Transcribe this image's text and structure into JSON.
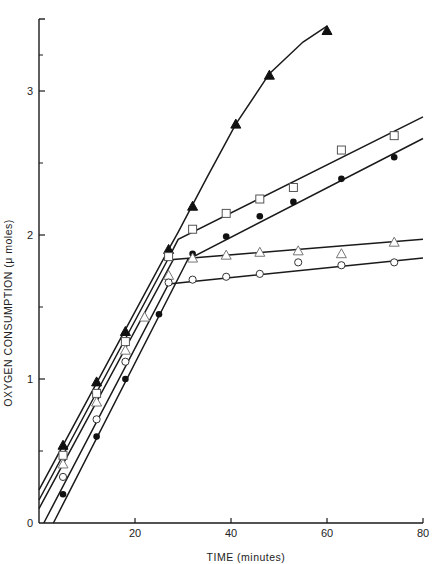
{
  "chart_data": {
    "type": "line",
    "title": "",
    "xlabel": "TIME (minutes)",
    "ylabel": "OXYGEN CONSUMPTION (μ moles)",
    "xlim": [
      0,
      80
    ],
    "ylim": [
      0,
      3.5
    ],
    "x_ticks": [
      20,
      40,
      60,
      80
    ],
    "x_tick_labels": [
      "20",
      "40",
      "60",
      "80"
    ],
    "y_ticks": [
      0,
      1,
      2,
      3
    ],
    "y_tick_labels": [
      "0",
      "1",
      "2",
      "3"
    ],
    "y_minor_ticks": [
      0.5,
      1.5,
      2.5,
      3.25
    ],
    "grid": false,
    "legend": null,
    "series": [
      {
        "name": "filled-triangle",
        "marker": "triangle-filled",
        "points": [
          [
            5,
            0.54
          ],
          [
            12,
            0.98
          ],
          [
            18,
            1.33
          ],
          [
            27,
            1.9
          ],
          [
            32,
            2.2
          ],
          [
            41,
            2.77
          ],
          [
            48,
            3.11
          ],
          [
            60,
            3.42
          ]
        ],
        "fit": [
          [
            0,
            0.23
          ],
          [
            27,
            1.9
          ],
          [
            29,
            2.02
          ],
          [
            35,
            2.4
          ],
          [
            41,
            2.77
          ],
          [
            48,
            3.12
          ],
          [
            55,
            3.34
          ],
          [
            60,
            3.45
          ]
        ]
      },
      {
        "name": "open-square",
        "marker": "square-open",
        "points": [
          [
            5,
            0.47
          ],
          [
            12,
            0.9
          ],
          [
            18,
            1.26
          ],
          [
            27,
            1.85
          ],
          [
            32,
            2.04
          ],
          [
            39,
            2.15
          ],
          [
            46,
            2.25
          ],
          [
            53,
            2.33
          ],
          [
            63,
            2.59
          ],
          [
            74,
            2.69
          ]
        ],
        "fit": [
          [
            0,
            0.16
          ],
          [
            27,
            1.84
          ],
          [
            29,
            1.97
          ],
          [
            80,
            2.82
          ]
        ]
      },
      {
        "name": "filled-circle",
        "marker": "circle-filled",
        "points": [
          [
            5,
            0.2
          ],
          [
            12,
            0.6
          ],
          [
            18,
            1.0
          ],
          [
            25,
            1.45
          ],
          [
            32,
            1.87
          ],
          [
            39,
            1.99
          ],
          [
            46,
            2.13
          ],
          [
            53,
            2.23
          ],
          [
            63,
            2.39
          ],
          [
            74,
            2.54
          ]
        ],
        "fit": [
          [
            3,
            0.0
          ],
          [
            31,
            1.83
          ],
          [
            80,
            2.67
          ]
        ]
      },
      {
        "name": "open-triangle",
        "marker": "triangle-open",
        "points": [
          [
            5,
            0.41
          ],
          [
            12,
            0.84
          ],
          [
            18,
            1.2
          ],
          [
            22,
            1.43
          ],
          [
            27,
            1.72
          ],
          [
            32,
            1.84
          ],
          [
            39,
            1.86
          ],
          [
            46,
            1.88
          ],
          [
            54,
            1.89
          ],
          [
            63,
            1.87
          ],
          [
            74,
            1.95
          ]
        ],
        "fit": [
          [
            0,
            0.1
          ],
          [
            28,
            1.83
          ],
          [
            80,
            1.97
          ]
        ]
      },
      {
        "name": "open-circle",
        "marker": "circle-open",
        "points": [
          [
            5,
            0.32
          ],
          [
            12,
            0.72
          ],
          [
            18,
            1.12
          ],
          [
            27,
            1.67
          ],
          [
            32,
            1.69
          ],
          [
            39,
            1.71
          ],
          [
            46,
            1.73
          ],
          [
            54,
            1.81
          ],
          [
            63,
            1.79
          ],
          [
            74,
            1.81
          ]
        ],
        "fit": [
          [
            1,
            0.0
          ],
          [
            27,
            1.66
          ],
          [
            80,
            1.84
          ]
        ]
      }
    ]
  },
  "caption": "Fig. 3.1  Oxygen consumption"
}
